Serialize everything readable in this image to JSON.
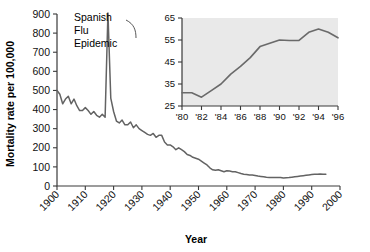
{
  "figure": {
    "background_color": "#ffffff",
    "line_color": "#636363",
    "axis_color": "#3a3a3a",
    "inset_panel_color": "#e9e9e9"
  },
  "main_axis": {
    "ylabel": "Mortality rate per 100,000",
    "xlabel": "Year",
    "y_ticks": [
      "0",
      "100",
      "200",
      "300",
      "400",
      "500",
      "600",
      "700",
      "800",
      "900"
    ],
    "x_ticks": [
      "1900",
      "1910",
      "1920",
      "1930",
      "1940",
      "1950",
      "1960",
      "1970",
      "1980",
      "1990",
      "2000"
    ]
  },
  "annotation": {
    "line1": "Spanish",
    "line2": "Flu",
    "line3": "Epidemic"
  },
  "inset_axis": {
    "y_ticks": [
      "25",
      "35",
      "45",
      "55",
      "65"
    ],
    "x_ticks": [
      "'80",
      "'82",
      "'84",
      "'86",
      "'88",
      "'90",
      "'92",
      "'94",
      "'96"
    ]
  },
  "chart_data": [
    {
      "type": "line",
      "title": "",
      "subtitle": "",
      "xlabel": "Year",
      "ylabel": "Mortality rate per 100,000",
      "xlim": [
        1900,
        2000
      ],
      "ylim": [
        0,
        900
      ],
      "grid": false,
      "legend": "none",
      "annotations": [
        {
          "text": "Spanish Flu Epidemic",
          "x": 1918,
          "y": 900,
          "note": "leader line points to 1918 spike"
        }
      ],
      "series": [
        {
          "name": "Infectious disease mortality rate",
          "x": [
            1900,
            1901,
            1902,
            1903,
            1904,
            1905,
            1906,
            1907,
            1908,
            1909,
            1910,
            1911,
            1912,
            1913,
            1914,
            1915,
            1916,
            1917,
            1918,
            1919,
            1920,
            1921,
            1922,
            1923,
            1924,
            1925,
            1926,
            1927,
            1928,
            1929,
            1930,
            1931,
            1932,
            1933,
            1934,
            1935,
            1936,
            1937,
            1938,
            1939,
            1940,
            1941,
            1942,
            1943,
            1944,
            1945,
            1946,
            1947,
            1948,
            1949,
            1950,
            1951,
            1952,
            1953,
            1954,
            1955,
            1956,
            1957,
            1958,
            1959,
            1960,
            1961,
            1962,
            1963,
            1964,
            1965,
            1966,
            1967,
            1968,
            1969,
            1970,
            1971,
            1972,
            1973,
            1974,
            1975,
            1976,
            1977,
            1978,
            1979,
            1980,
            1981,
            1982,
            1983,
            1984,
            1985,
            1986,
            1987,
            1988,
            1989,
            1990,
            1991,
            1992,
            1993,
            1994,
            1995
          ],
          "values": [
            500,
            480,
            430,
            455,
            470,
            430,
            455,
            420,
            395,
            395,
            410,
            395,
            375,
            390,
            370,
            360,
            375,
            360,
            905,
            460,
            390,
            340,
            330,
            345,
            320,
            320,
            335,
            305,
            320,
            300,
            290,
            280,
            270,
            265,
            275,
            255,
            265,
            265,
            230,
            215,
            215,
            205,
            190,
            200,
            190,
            180,
            165,
            160,
            150,
            145,
            140,
            130,
            120,
            110,
            95,
            85,
            82,
            85,
            80,
            75,
            80,
            78,
            75,
            75,
            70,
            65,
            62,
            60,
            58,
            57,
            55,
            52,
            50,
            48,
            46,
            45,
            44,
            44,
            45,
            44,
            42,
            43,
            44,
            46,
            48,
            50,
            52,
            54,
            56,
            58,
            60,
            61,
            62,
            63,
            62,
            62
          ]
        }
      ]
    },
    {
      "type": "line",
      "title": "",
      "subtitle": "Inset: 1980-1996 detail",
      "xlabel": "",
      "ylabel": "",
      "xlim": [
        1980,
        1996
      ],
      "ylim": [
        25,
        65
      ],
      "grid": false,
      "legend": "none",
      "series": [
        {
          "name": "Infectious disease mortality rate (1980-1996)",
          "x": [
            1980,
            1981,
            1982,
            1983,
            1984,
            1985,
            1986,
            1987,
            1988,
            1989,
            1990,
            1991,
            1992,
            1993,
            1994,
            1995,
            1996
          ],
          "values": [
            31,
            31,
            29,
            32,
            35,
            39.5,
            43,
            47,
            52,
            53.5,
            55,
            54.8,
            54.8,
            58.5,
            60,
            58.5,
            56
          ]
        }
      ]
    }
  ]
}
